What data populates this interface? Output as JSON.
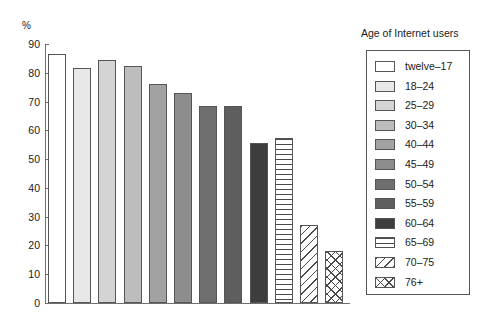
{
  "chart_data": {
    "type": "bar",
    "title": "",
    "xlabel": "",
    "ylabel": "%",
    "ylim": [
      0,
      90
    ],
    "grid": false,
    "legend_position": "right",
    "legend_title": "Age of Internet users",
    "categories": [
      "twelve–17",
      "18–24",
      "25–29",
      "30–34",
      "40–44",
      "45–49",
      "50–54",
      "55–59",
      "60–64",
      "65–69",
      "70–75",
      "76+"
    ],
    "values": [
      86.5,
      81.5,
      84.5,
      82.5,
      76,
      73,
      68.5,
      68.5,
      55.5,
      57.5,
      27,
      18
    ],
    "yticks": [
      0,
      10,
      20,
      30,
      40,
      50,
      60,
      70,
      80,
      90
    ],
    "ytick_labels": [
      "0",
      "10",
      "20",
      "30",
      "40",
      "50",
      "60",
      "70",
      "80",
      "90"
    ],
    "bar_fills": [
      "#ffffff",
      "#e8e8e8",
      "#d4d4d4",
      "#bdbdbd",
      "#a2a2a2",
      "#8d8d8d",
      "#6e6e6e",
      "#5e5e5e",
      "#3d3d3d",
      "pattern-horizontal",
      "pattern-diagonal",
      "pattern-crosshatch"
    ]
  },
  "axis": {
    "percent_symbol": "%"
  }
}
